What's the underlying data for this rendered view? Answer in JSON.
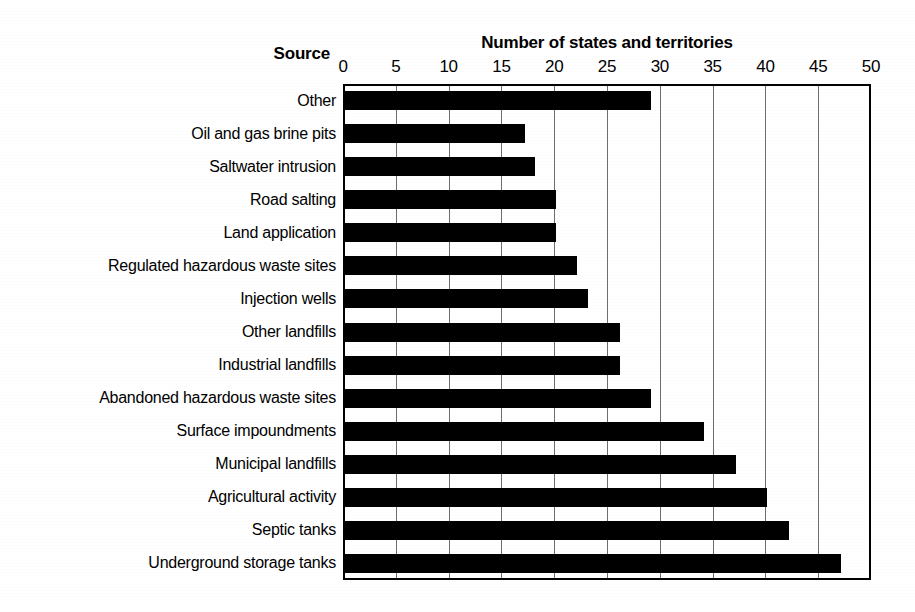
{
  "chart_data": {
    "type": "bar",
    "orientation": "horizontal",
    "title": "Number of states and territories",
    "xlabel": "Number of states and territories",
    "ylabel": "Source",
    "xlim": [
      0,
      50
    ],
    "xticks": [
      0,
      5,
      10,
      15,
      20,
      25,
      30,
      35,
      40,
      45,
      50
    ],
    "grid": true,
    "legend": "none",
    "bar_color": "#000000",
    "categories": [
      "Other",
      "Oil and gas brine pits",
      "Saltwater intrusion",
      "Road salting",
      "Land application",
      "Regulated hazardous waste sites",
      "Injection wells",
      "Other landfills",
      "Industrial landfills",
      "Abandoned hazardous waste sites",
      "Surface impoundments",
      "Municipal landfills",
      "Agricultural activity",
      "Septic tanks",
      "Underground storage tanks"
    ],
    "values": [
      29,
      17,
      18,
      20,
      20,
      22,
      23,
      26,
      26,
      29,
      34,
      37,
      40,
      42,
      47
    ]
  },
  "labels": {
    "source_header": "Source"
  }
}
